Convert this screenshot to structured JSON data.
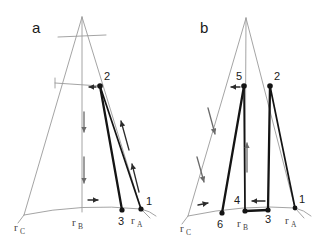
{
  "figure": {
    "title": "",
    "background_color": "#ffffff",
    "width": 323,
    "height": 241
  },
  "colors": {
    "thin_stroke": "#9a9a9a",
    "thick_stroke": "#141414",
    "node_fill": "#141414",
    "arrow_dark": "#2b2b2b",
    "arrow_gray": "#6a6a6a",
    "label_text": "#1a1a1a",
    "corner_text": "#444444"
  },
  "panels": [
    {
      "id": "panel-a",
      "letter": "a",
      "letter_pos": {
        "x": 32,
        "y": 33
      },
      "apex": {
        "x": 82,
        "y": 17
      },
      "corners": [
        {
          "name": "r_C",
          "base": "r",
          "sub": "C",
          "x": 24,
          "y": 215,
          "label_x": 17,
          "label_y": 229
        },
        {
          "name": "r_B",
          "base": "r",
          "sub": "B",
          "x": 82,
          "y": 212,
          "label_x": 74,
          "label_y": 226
        },
        {
          "name": "r_A",
          "base": "r",
          "sub": "A",
          "x": 141,
          "y": 209,
          "label_x": 133,
          "label_y": 224
        }
      ],
      "nodes": [
        {
          "label": "1",
          "x": 141,
          "y": 209,
          "label_x": 146,
          "label_y": 205
        },
        {
          "label": "2",
          "x": 100,
          "y": 86,
          "label_x": 104,
          "label_y": 80
        },
        {
          "label": "3",
          "x": 122,
          "y": 210,
          "label_x": 118,
          "label_y": 225
        }
      ],
      "thick_segments": [
        {
          "from": "2",
          "to": "3",
          "weight": "thick"
        },
        {
          "from": "2",
          "to": "1",
          "weight": "medium"
        }
      ],
      "arrows": [
        {
          "name": "arrow-into-2",
          "direction": "left",
          "x1": 96,
          "y1": 87,
          "x2": 88,
          "y2": 87,
          "tone": "dark"
        },
        {
          "name": "arrow-down-upper",
          "direction": "down",
          "x1": 84,
          "y1": 112,
          "x2": 84,
          "y2": 133,
          "tone": "gray"
        },
        {
          "name": "arrow-down-lower",
          "direction": "down",
          "x1": 84,
          "y1": 157,
          "x2": 84,
          "y2": 184,
          "tone": "gray"
        },
        {
          "name": "arrow-up-upper",
          "direction": "up-left",
          "x1": 129,
          "y1": 150,
          "x2": 120,
          "y2": 120,
          "tone": "dark"
        },
        {
          "name": "arrow-up-lower",
          "direction": "up-left",
          "x1": 139,
          "y1": 192,
          "x2": 131,
          "y2": 163,
          "tone": "dark"
        },
        {
          "name": "arrow-right-base",
          "direction": "right",
          "x1": 88,
          "y1": 200,
          "x2": 99,
          "y2": 200,
          "tone": "dark"
        }
      ]
    },
    {
      "id": "panel-b",
      "letter": "b",
      "letter_pos": {
        "x": 200,
        "y": 33
      },
      "apex": {
        "x": 246,
        "y": 18
      },
      "corners": [
        {
          "name": "r_C",
          "base": "r",
          "sub": "C",
          "x": 188,
          "y": 216,
          "label_x": 182,
          "label_y": 230
        },
        {
          "name": "r_B",
          "base": "r",
          "sub": "B",
          "x": 245,
          "y": 211,
          "label_x": 238,
          "label_y": 226
        },
        {
          "name": "r_A",
          "base": "r",
          "sub": "A",
          "x": 295,
          "y": 208,
          "label_x": 287,
          "label_y": 224
        }
      ],
      "nodes": [
        {
          "label": "1",
          "x": 295,
          "y": 208,
          "label_x": 300,
          "label_y": 203
        },
        {
          "label": "2",
          "x": 270,
          "y": 86,
          "label_x": 274,
          "label_y": 80
        },
        {
          "label": "3",
          "x": 268,
          "y": 210,
          "label_x": 266,
          "label_y": 223
        },
        {
          "label": "4",
          "x": 245,
          "y": 211,
          "label_x": 238,
          "label_y": 204
        },
        {
          "label": "5",
          "x": 244,
          "y": 86,
          "label_x": 238,
          "label_y": 80
        },
        {
          "label": "6",
          "x": 222,
          "y": 213,
          "label_x": 218,
          "label_y": 228
        }
      ],
      "thick_segments": [
        {
          "from": "2",
          "to": "1",
          "weight": "medium"
        },
        {
          "from": "2",
          "to": "3",
          "weight": "thick"
        },
        {
          "from": "4",
          "to": "3",
          "weight": "thick"
        },
        {
          "from": "5",
          "to": "4",
          "weight": "medium"
        },
        {
          "from": "5",
          "to": "6",
          "weight": "thick"
        }
      ],
      "arrows": [
        {
          "name": "arrow-into-5",
          "direction": "left",
          "x1": 240,
          "y1": 87,
          "x2": 230,
          "y2": 87,
          "tone": "dark"
        },
        {
          "name": "arrow-down-upper",
          "direction": "down-right",
          "x1": 208,
          "y1": 108,
          "x2": 216,
          "y2": 135,
          "tone": "gray"
        },
        {
          "name": "arrow-down-lower",
          "direction": "down-right",
          "x1": 197,
          "y1": 157,
          "x2": 205,
          "y2": 183,
          "tone": "gray"
        },
        {
          "name": "arrow-up-center",
          "direction": "up",
          "x1": 247,
          "y1": 172,
          "x2": 247,
          "y2": 142,
          "tone": "gray"
        },
        {
          "name": "arrow-left-base",
          "direction": "left",
          "x1": 265,
          "y1": 201,
          "x2": 251,
          "y2": 201,
          "tone": "dark"
        },
        {
          "name": "arrow-right-base",
          "direction": "right",
          "x1": 198,
          "y1": 205,
          "x2": 209,
          "y2": 203,
          "tone": "dark"
        }
      ]
    }
  ]
}
